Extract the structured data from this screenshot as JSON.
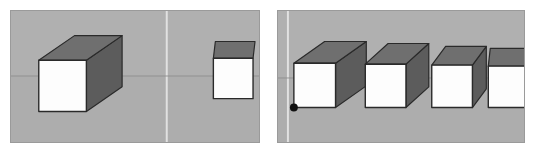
{
  "figure": {
    "page_background": "#ffffff",
    "panel_count": 2
  },
  "palette": {
    "viewport_background": "#b0b0b0",
    "viewport_border": "#9a9a9a",
    "ground_below": "#ababab",
    "cube_front_face": "#fdfdfd",
    "cube_top_face": "#6f6f6f",
    "cube_right_face": "#5c5c5c",
    "cube_outline": "#2a2a2a",
    "axis_horizontal": "#8e8e8e",
    "axis_vertical": "#e4e4e4",
    "vertex_marker": "#111111"
  },
  "panels": [
    {
      "id": "left-viewport",
      "name": "left-viewport",
      "label": "Left viewport",
      "background": "#b0b0b0",
      "axes": {
        "horizontal": {
          "label": "horizon-line",
          "y": 66,
          "color": "#8e8e8e",
          "width": 1
        },
        "vertical": {
          "label": "vertical-axis-line",
          "x": 157,
          "color": "#e4e4e4",
          "width": 2
        }
      },
      "cubes": [
        {
          "id": "left-cube-near",
          "name": "cube-near-left",
          "label": "Near cube, three-quarter view",
          "faces_visible": [
            "front",
            "top",
            "right"
          ],
          "front": {
            "x": 28,
            "y": 50,
            "w": 48,
            "h": 52
          },
          "depth_dx": 36,
          "depth_dy": -25,
          "vertex_marker": false
        },
        {
          "id": "left-cube-far",
          "name": "cube-far-right",
          "label": "Far cube, near head-on view",
          "faces_visible": [
            "front",
            "top"
          ],
          "front": {
            "x": 204,
            "y": 48,
            "w": 40,
            "h": 41
          },
          "depth_dx": 2,
          "depth_dy": -17,
          "vertex_marker": false
        }
      ]
    },
    {
      "id": "right-viewport",
      "name": "right-viewport",
      "label": "Right viewport",
      "background": "#b0b0b0",
      "axes": {
        "horizontal": {
          "label": "horizon-line",
          "y": 68,
          "color": "#8e8e8e",
          "width": 1
        },
        "vertical": {
          "label": "vertical-axis-line",
          "x": 10,
          "color": "#e4e4e4",
          "width": 2
        }
      },
      "cubes": [
        {
          "id": "right-cube-1",
          "name": "cube-row-item-1",
          "label": "Cube 1, widest three-quarter view",
          "faces_visible": [
            "front",
            "top",
            "right"
          ],
          "front": {
            "x": 16,
            "y": 53,
            "w": 42,
            "h": 45
          },
          "depth_dx": 31,
          "depth_dy": -22,
          "vertex_marker": true,
          "marker_position": "bottom-left",
          "marker_radius": 4
        },
        {
          "id": "right-cube-2",
          "name": "cube-row-item-2",
          "label": "Cube 2, moderate three-quarter view",
          "faces_visible": [
            "front",
            "top",
            "right"
          ],
          "front": {
            "x": 88,
            "y": 54,
            "w": 41,
            "h": 44
          },
          "depth_dx": 23,
          "depth_dy": -21,
          "vertex_marker": false
        },
        {
          "id": "right-cube-3",
          "name": "cube-row-item-3",
          "label": "Cube 3, narrow three-quarter view",
          "faces_visible": [
            "front",
            "top",
            "right"
          ],
          "front": {
            "x": 155,
            "y": 55,
            "w": 41,
            "h": 43
          },
          "depth_dx": 14,
          "depth_dy": -19,
          "vertex_marker": false
        },
        {
          "id": "right-cube-4",
          "name": "cube-row-item-4",
          "label": "Cube 4, head-on view",
          "faces_visible": [
            "front",
            "top"
          ],
          "front": {
            "x": 212,
            "y": 56,
            "w": 39,
            "h": 42
          },
          "depth_dx": 2,
          "depth_dy": -18,
          "vertex_marker": false
        }
      ]
    }
  ]
}
